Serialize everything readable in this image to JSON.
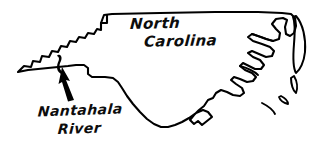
{
  "figure": {
    "kind": "hand-drawn-map",
    "background_color": "#ffffff",
    "ink_color": "#000000",
    "width": 320,
    "height": 152
  },
  "labels": {
    "state": {
      "line_1": "North",
      "line_2": "Carolina",
      "full_text": "North Carolina"
    },
    "river": {
      "line_1": "Nantahala",
      "line_2": "River",
      "full_text": "Nantahala River"
    }
  },
  "marks": {
    "river_mark_name": "nantahala-river-mark",
    "pointer_name": "leader-arrow",
    "outline_name": "north-carolina-outline"
  }
}
